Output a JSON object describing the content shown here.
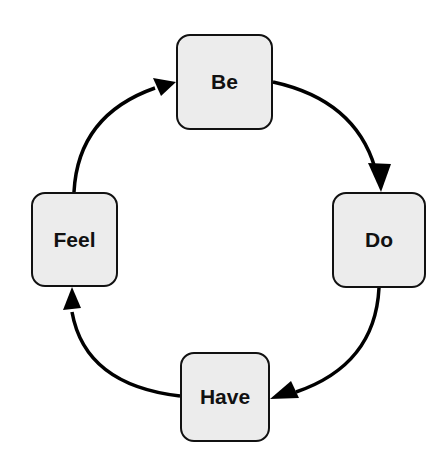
{
  "diagram": {
    "type": "cycle",
    "direction": "clockwise",
    "colors": {
      "node_fill": "#ececec",
      "node_border": "#111111",
      "arrow": "#000000",
      "text": "#111111",
      "background": "#ffffff"
    },
    "nodes": [
      {
        "id": "be",
        "label": "Be"
      },
      {
        "id": "do",
        "label": "Do"
      },
      {
        "id": "have",
        "label": "Have"
      },
      {
        "id": "feel",
        "label": "Feel"
      }
    ],
    "edges": [
      {
        "from": "be",
        "to": "do"
      },
      {
        "from": "do",
        "to": "have"
      },
      {
        "from": "have",
        "to": "feel"
      },
      {
        "from": "feel",
        "to": "be"
      }
    ]
  }
}
